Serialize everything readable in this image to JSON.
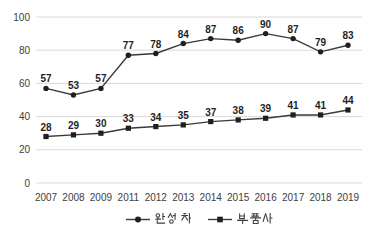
{
  "chart_data": {
    "type": "line",
    "title": "",
    "xlabel": "",
    "ylabel": "",
    "categories": [
      "2007",
      "2008",
      "2009",
      "2011",
      "2012",
      "2013",
      "2014",
      "2015",
      "2016",
      "2017",
      "2018",
      "2019"
    ],
    "series": [
      {
        "name": "완성차",
        "marker": "circle",
        "values": [
          57,
          53,
          57,
          77,
          78,
          84,
          87,
          86,
          90,
          87,
          79,
          83
        ]
      },
      {
        "name": "부품사",
        "marker": "square",
        "values": [
          28,
          29,
          30,
          33,
          34,
          35,
          37,
          38,
          39,
          41,
          41,
          44
        ]
      }
    ],
    "ylim": [
      0,
      100
    ],
    "yticks": [
      0,
      20,
      40,
      60,
      80,
      100
    ],
    "grid": "horizontal",
    "data_labels": true,
    "legend_position": "bottom",
    "colors": {
      "line": "#3a3a3a",
      "marker": "#1f1f1f",
      "gridline": "#d9d9d9",
      "axis_text": "#404040",
      "label_text": "#1f1f1f",
      "legend_text": "#404040"
    }
  }
}
